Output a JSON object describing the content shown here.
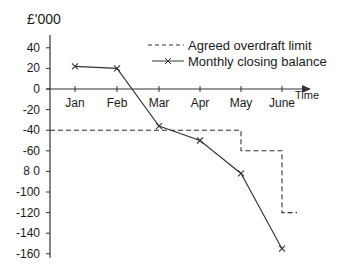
{
  "chart_data": {
    "type": "line",
    "title": "",
    "unit_label": "£'000",
    "xlabel": "Time",
    "ylabel": "£'000",
    "categories": [
      "Jan",
      "Feb",
      "Mar",
      "Apr",
      "May",
      "June"
    ],
    "ylim": [
      -160,
      40
    ],
    "yticks": [
      40,
      20,
      0,
      -20,
      -40,
      -60,
      -80,
      -100,
      -120,
      -140,
      -160
    ],
    "ytick_labels": [
      "40",
      "20",
      "0",
      "-20",
      "-40",
      "-60",
      "8 0",
      "-100",
      "-120",
      "-140",
      "-160"
    ],
    "grid": false,
    "legend_position": "upper right",
    "series": [
      {
        "name": "Agreed overdraft limit",
        "style": "dashed",
        "marker": "none",
        "step_segments": [
          {
            "from": "y-axis",
            "to": "May",
            "value": -40
          },
          {
            "from": "May",
            "to": "June",
            "value": -60
          },
          {
            "from": "June",
            "to": "after June",
            "value": -120
          }
        ],
        "values": [
          -40,
          -40,
          -40,
          -40,
          -60,
          -120
        ]
      },
      {
        "name": "Monthly closing balance",
        "style": "solid",
        "marker": "x",
        "values": [
          22,
          20,
          -36,
          -50,
          -82,
          -155
        ]
      }
    ]
  },
  "legend": {
    "items": [
      {
        "label": "Agreed overdraft limit"
      },
      {
        "label": "Monthly closing balance"
      }
    ]
  },
  "colors": {
    "line": "#333333",
    "text": "#1a1a1a",
    "background": "#ffffff"
  }
}
